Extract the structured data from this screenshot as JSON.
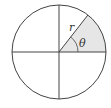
{
  "diagram": {
    "type": "circle-sector",
    "circle": {
      "cx": 59,
      "cy": 52,
      "r": 47
    },
    "sector": {
      "start_angle_deg": 0,
      "end_angle_deg": 52,
      "fill": "#e6e6e6"
    },
    "stroke_color": "#444444",
    "labels": {
      "radius": "r",
      "angle": "θ"
    }
  }
}
